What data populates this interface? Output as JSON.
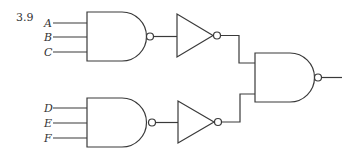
{
  "figure": {
    "number": "3.9",
    "inputs": {
      "top": [
        "A",
        "B",
        "C"
      ],
      "bottom": [
        "D",
        "E",
        "F"
      ]
    },
    "gates": [
      {
        "id": "nand-top",
        "type": "NAND",
        "inputs": [
          "A",
          "B",
          "C"
        ]
      },
      {
        "id": "inv-top",
        "type": "NOT",
        "inputs": [
          "nand-top"
        ]
      },
      {
        "id": "nand-bottom",
        "type": "NAND",
        "inputs": [
          "D",
          "E",
          "F"
        ]
      },
      {
        "id": "inv-bottom",
        "type": "NOT",
        "inputs": [
          "nand-bottom"
        ]
      },
      {
        "id": "nand-out",
        "type": "NAND",
        "inputs": [
          "inv-top",
          "inv-bottom"
        ]
      }
    ],
    "colors": {
      "line": "#3a3a3a",
      "background": "#ffffff"
    }
  }
}
